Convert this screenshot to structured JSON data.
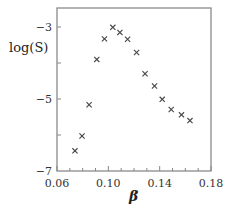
{
  "chart_data": {
    "type": "scatter",
    "title": "",
    "xlabel": "β",
    "ylabel": "log(S)",
    "xlim": [
      0.06,
      0.18
    ],
    "ylim": [
      -7,
      -2.5
    ],
    "xticks": [
      0.06,
      0.1,
      0.14,
      0.18
    ],
    "xtick_labels": [
      "0.06",
      "0.10",
      "0.14",
      "0.18"
    ],
    "yticks": [
      -3,
      -5,
      -7
    ],
    "ytick_labels": [
      "−3",
      "−5",
      "−7"
    ],
    "grid": false,
    "legend": null,
    "marker": "x",
    "series": [
      {
        "name": "log(S) vs β",
        "x": [
          0.074,
          0.0795,
          0.085,
          0.091,
          0.097,
          0.1035,
          0.109,
          0.115,
          0.122,
          0.1286,
          0.136,
          0.142,
          0.149,
          0.157,
          0.1636
        ],
        "y": [
          -6.44,
          -6.03,
          -5.16,
          -3.9,
          -3.33,
          -3.01,
          -3.15,
          -3.34,
          -3.71,
          -4.3,
          -4.64,
          -5.01,
          -5.29,
          -5.44,
          -5.6
        ]
      }
    ]
  },
  "colors": {
    "axis": "#888888",
    "marker": "#444444",
    "text": "#333333"
  }
}
